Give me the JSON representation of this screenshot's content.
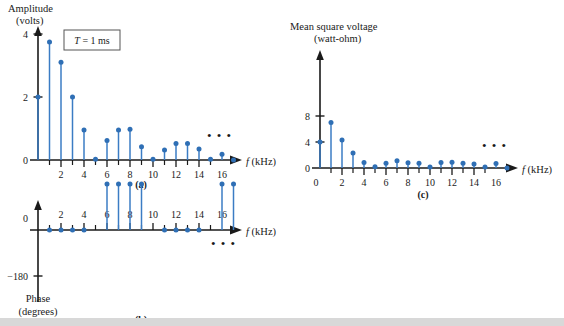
{
  "figure": {
    "background": "#ffffff",
    "stem_color": "#3b7cc4",
    "dot_color": "#2f6fb5",
    "axis_color": "#1a1a1a",
    "panels": [
      "(a)",
      "(b)",
      "(c)"
    ]
  },
  "panel_a": {
    "label": "(a)",
    "ylabel_line1": "Amplitude",
    "ylabel_line2": "(volts)",
    "xlabel": "f (kHz)",
    "xlabel_italic": "f",
    "xlabel_rest": " (kHz)",
    "annotation": "T = 1 ms",
    "annotation_italic": "T",
    "annotation_rest": " = 1 ms",
    "ellipsis": "• • •",
    "yticks": [
      "0",
      "2",
      "4"
    ],
    "xticks": [
      "0",
      "2",
      "4",
      "6",
      "8",
      "10",
      "12",
      "14",
      "16"
    ]
  },
  "panel_b": {
    "label": "(b)",
    "ylabel_line1": "Phase",
    "ylabel_line2": "(degrees)",
    "xlabel_italic": "f",
    "xlabel_rest": " (kHz)",
    "ellipsis": "• • •",
    "yticks": [
      "0",
      "−180"
    ],
    "xticks": [
      "2",
      "4",
      "6",
      "8",
      "10",
      "12",
      "14",
      "16"
    ]
  },
  "panel_c": {
    "label": "(c)",
    "ylabel_line1": "Mean square voltage",
    "ylabel_line2": "(watt-ohm)",
    "xlabel_italic": "f",
    "xlabel_rest": " (kHz)",
    "ellipsis": "• • •",
    "yticks": [
      "0",
      "4",
      "8"
    ],
    "xticks": [
      "0",
      "2",
      "4",
      "6",
      "8",
      "10",
      "12",
      "14",
      "16"
    ]
  },
  "chart_data": [
    {
      "type": "line",
      "subtype": "stem",
      "panel": "(a)",
      "title": "Amplitude spectrum",
      "xlabel": "f (kHz)",
      "ylabel": "Amplitude (volts)",
      "annotation": "T = 1 ms",
      "xlim": [
        0,
        17.8
      ],
      "ylim": [
        0,
        4.4
      ],
      "xticks": [
        0,
        2,
        4,
        6,
        8,
        10,
        12,
        14,
        16
      ],
      "yticks": [
        0,
        2,
        4
      ],
      "grid": false,
      "legend": null,
      "x": [
        0,
        1,
        2,
        3,
        4,
        5,
        6,
        7,
        8,
        9,
        10,
        11,
        12,
        13,
        14,
        15,
        16,
        17
      ],
      "values": [
        2.0,
        3.75,
        3.1,
        2.0,
        0.95,
        0.02,
        0.62,
        0.95,
        0.98,
        0.42,
        0.02,
        0.32,
        0.52,
        0.52,
        0.35,
        0.02,
        0.18,
        0.0
      ],
      "trailing_ellipsis": true
    },
    {
      "type": "line",
      "subtype": "stem",
      "panel": "(b)",
      "title": "Phase spectrum",
      "xlabel": "f (kHz)",
      "ylabel": "Phase (degrees)",
      "xlim": [
        0,
        17.8
      ],
      "ylim": [
        -180,
        0
      ],
      "xticks": [
        2,
        4,
        6,
        8,
        10,
        12,
        14,
        16
      ],
      "yticks": [
        0,
        -180
      ],
      "grid": false,
      "legend": null,
      "x": [
        1,
        2,
        3,
        4,
        6,
        7,
        8,
        9,
        11,
        12,
        13,
        14,
        16,
        17
      ],
      "values": [
        0,
        0,
        0,
        0,
        -180,
        -180,
        -180,
        -180,
        0,
        0,
        0,
        0,
        -180,
        -180
      ],
      "trailing_ellipsis": true
    },
    {
      "type": "line",
      "subtype": "stem",
      "panel": "(c)",
      "title": "Mean square voltage spectrum",
      "xlabel": "f (kHz)",
      "ylabel": "Mean square voltage (watt-ohm)",
      "xlim": [
        0,
        17.8
      ],
      "ylim": [
        0,
        9.5
      ],
      "xticks": [
        0,
        2,
        4,
        6,
        8,
        10,
        12,
        14,
        16
      ],
      "yticks": [
        0,
        4,
        8
      ],
      "grid": false,
      "legend": null,
      "x": [
        0,
        1,
        2,
        3,
        4,
        5,
        6,
        7,
        8,
        9,
        10,
        11,
        12,
        13,
        14,
        15,
        16,
        17
      ],
      "values": [
        4.0,
        7.0,
        4.3,
        2.3,
        0.85,
        0.2,
        0.75,
        1.1,
        0.8,
        0.75,
        0.15,
        0.85,
        0.9,
        0.75,
        0.6,
        0.15,
        0.7,
        0.0
      ],
      "trailing_ellipsis": true
    }
  ]
}
